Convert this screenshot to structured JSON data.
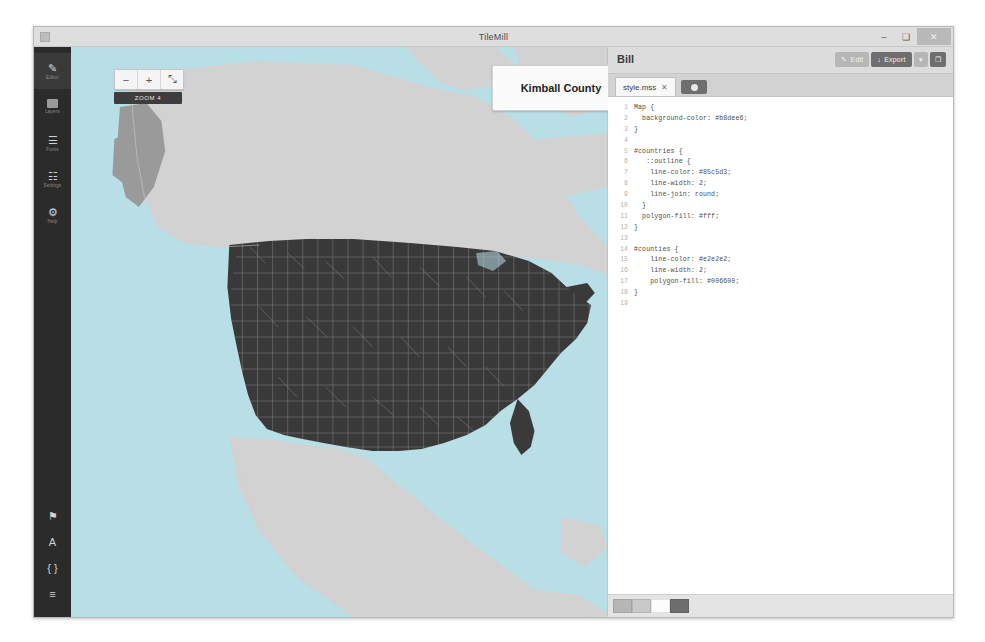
{
  "window": {
    "app_title": "TileMill",
    "controls": {
      "minimize": "–",
      "maximize": "❑",
      "close": "✕"
    }
  },
  "sidebar": {
    "top_items": [
      {
        "label": "Editor",
        "icon": "pencil-icon",
        "glyph": "✎",
        "active": true
      },
      {
        "label": "Layers",
        "icon": "layers-icon",
        "glyph": "■",
        "active": false
      },
      {
        "label": "Fonts",
        "icon": "font-swatch-icon",
        "glyph": "☰",
        "active": false
      },
      {
        "label": "Settings",
        "icon": "sliders-icon",
        "glyph": "☷",
        "active": false
      },
      {
        "label": "Help",
        "icon": "gear-icon",
        "glyph": "⚙",
        "active": false
      }
    ],
    "bottom_items": [
      {
        "label": "",
        "icon": "marker-icon",
        "glyph": "⚑"
      },
      {
        "label": "",
        "icon": "font-icon",
        "glyph": "A"
      },
      {
        "label": "",
        "icon": "braces-icon",
        "glyph": "{ }"
      },
      {
        "label": "",
        "icon": "list-icon",
        "glyph": "≡"
      }
    ]
  },
  "map": {
    "zoom_controls": {
      "zoom_out_label": "−",
      "zoom_in_label": "+",
      "fullscreen_label": "⤡"
    },
    "zoom_level_label": "ZOOM 4",
    "tooltip": {
      "title": "Kimball County"
    },
    "colors": {
      "background": "#b8dee6",
      "countries_fill": "#ffffff",
      "counties_fill": "#006600",
      "counties_line": "#e2e2e2",
      "countries_line": "#85c5d3"
    }
  },
  "code_panel": {
    "project_title": "Bill",
    "toolbar": [
      {
        "label": "Edit",
        "icon": "pencil-icon",
        "glyph": "✎",
        "style": "light"
      },
      {
        "label": "Export",
        "icon": "export-icon",
        "glyph": "↓",
        "style": "dark"
      },
      {
        "label": "",
        "icon": "chevron-down-icon",
        "glyph": "▾",
        "style": "light"
      },
      {
        "label": "",
        "icon": "save-icon",
        "glyph": "❐",
        "style": "dark"
      }
    ],
    "tabs": [
      {
        "name": "style.mss",
        "close": "✕"
      }
    ],
    "add_tab_label": "",
    "lines": [
      {
        "n": "1",
        "text": "Map {"
      },
      {
        "n": "2",
        "text": "  background-color: #b8dee6;"
      },
      {
        "n": "3",
        "text": "}"
      },
      {
        "n": "4",
        "text": ""
      },
      {
        "n": "5",
        "text": "#countries {"
      },
      {
        "n": "6",
        "text": "   ::outline {"
      },
      {
        "n": "7",
        "text": "    line-color: #85c5d3;"
      },
      {
        "n": "8",
        "text": "    line-width: 2;"
      },
      {
        "n": "9",
        "text": "    line-join: round;"
      },
      {
        "n": "10",
        "text": "  }"
      },
      {
        "n": "11",
        "text": "  polygon-fill: #fff;"
      },
      {
        "n": "12",
        "text": "}"
      },
      {
        "n": "13",
        "text": ""
      },
      {
        "n": "14",
        "text": "#counties {"
      },
      {
        "n": "15",
        "text": "    line-color: #e2e2e2;"
      },
      {
        "n": "16",
        "text": "    line-width: 2;"
      },
      {
        "n": "17",
        "text": "    polygon-fill: #006600;"
      },
      {
        "n": "18",
        "text": "}"
      },
      {
        "n": "19",
        "text": ""
      }
    ],
    "footer_swatches": [
      "#b6b6b6",
      "#c9c9c9",
      "#fcfcfc",
      "#6d6d6d"
    ]
  }
}
